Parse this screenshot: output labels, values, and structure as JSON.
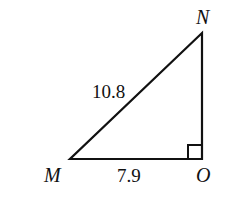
{
  "diagram": {
    "type": "right-triangle",
    "vertices": {
      "M": {
        "label": "M",
        "x": 70,
        "y": 159
      },
      "O": {
        "label": "O",
        "x": 202,
        "y": 159
      },
      "N": {
        "label": "N",
        "x": 202,
        "y": 33
      }
    },
    "sides": {
      "MN": {
        "label": "10.8"
      },
      "MO": {
        "label": "7.9"
      }
    },
    "right_angle_at": "O",
    "colors": {
      "stroke": "#111111",
      "background": "#ffffff"
    }
  }
}
